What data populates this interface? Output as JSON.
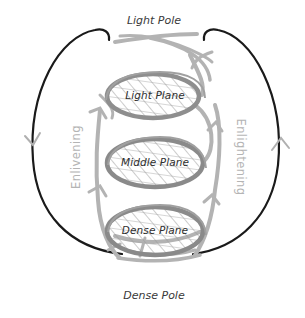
{
  "diagram": {
    "poles": {
      "top": "Light Pole",
      "bottom": "Dense Pole"
    },
    "planes": [
      {
        "label": "Light Plane"
      },
      {
        "label": "Middle Plane"
      },
      {
        "label": "Dense Plane"
      }
    ],
    "flows": {
      "left": "Enlivening",
      "right": "Enlightening"
    },
    "colors": {
      "outline": "#1a1a1a",
      "spiral": "#a9a9a9",
      "plane_ring": "#8c8c8c",
      "hatch": "#9a9a9a",
      "flow_text": "#b4b4b4",
      "label_text": "#333333"
    }
  }
}
